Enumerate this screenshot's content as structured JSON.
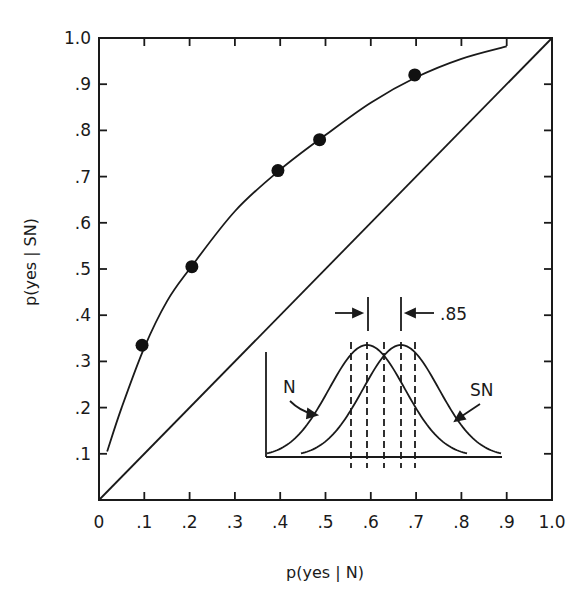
{
  "chart_data": {
    "type": "line",
    "title": "",
    "xlabel": "p(yes | N)",
    "ylabel": "p(yes | SN)",
    "xlim": [
      0,
      1.0
    ],
    "ylim": [
      0,
      1.0
    ],
    "grid": false,
    "x_ticks": [
      "0",
      ".1",
      ".2",
      ".3",
      ".4",
      ".5",
      ".6",
      ".7",
      ".8",
      ".9",
      "1.0"
    ],
    "y_ticks": [
      ".1",
      ".2",
      ".3",
      ".4",
      ".5",
      ".6",
      ".7",
      ".8",
      ".9",
      "1.0"
    ],
    "series": [
      {
        "name": "observed points",
        "kind": "scatter",
        "x": [
          0.095,
          0.205,
          0.395,
          0.487,
          0.697
        ],
        "y": [
          0.335,
          0.505,
          0.713,
          0.78,
          0.92
        ]
      },
      {
        "name": "fitted ROC curve",
        "kind": "line",
        "x": [
          0.018,
          0.05,
          0.1,
          0.15,
          0.2,
          0.3,
          0.4,
          0.5,
          0.6,
          0.7,
          0.8,
          0.9
        ],
        "y": [
          0.105,
          0.2,
          0.33,
          0.43,
          0.5,
          0.625,
          0.715,
          0.79,
          0.86,
          0.915,
          0.955,
          0.982
        ]
      },
      {
        "name": "chance diagonal",
        "kind": "line",
        "x": [
          0,
          1.0
        ],
        "y": [
          0,
          1.0
        ]
      }
    ],
    "inset": {
      "description": "Overlapping N and SN normal distributions with d' separation",
      "labels": {
        "noise": "N",
        "signal_noise": "SN",
        "separation": ".85"
      },
      "criteria_count": 5
    }
  }
}
